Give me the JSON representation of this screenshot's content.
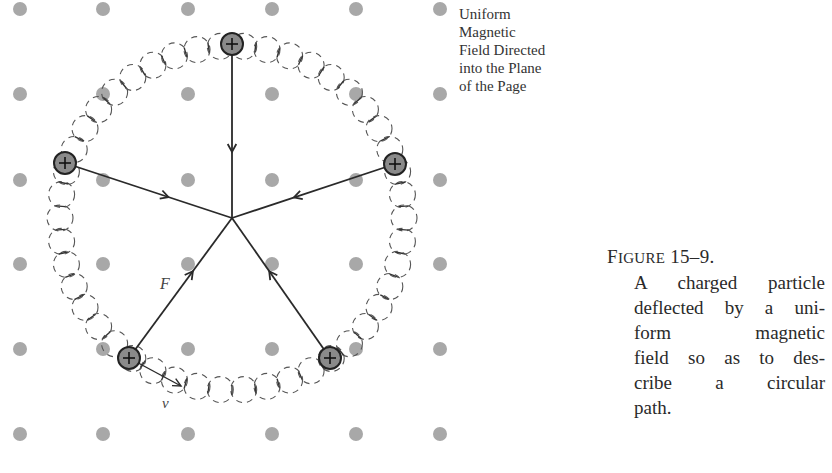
{
  "field_label": {
    "lines": [
      "Uniform",
      "Magnetic",
      "Field Directed",
      "into the Plane",
      "of the Page"
    ]
  },
  "caption": {
    "figure_prefix": "F",
    "figure_smallcaps": "IGURE",
    "figure_number": " 15–9.",
    "lines": [
      "A charged particle",
      "deflected by a uni-",
      "form magnetic",
      "field so as to des-",
      "cribe a circular",
      "path."
    ]
  },
  "labels": {
    "force": "F",
    "velocity": "v"
  },
  "colors": {
    "field_dot": "#a8a8a8",
    "charge_fill": "#8a8a8a",
    "line": "#2a2a2a",
    "background": "#ffffff"
  },
  "geometry": {
    "center": [
      232,
      218
    ],
    "path_radius": 172,
    "grid_x": [
      20,
      103,
      188,
      272,
      356,
      440
    ],
    "grid_y": [
      9,
      94,
      180,
      264,
      349,
      434
    ],
    "charges": [
      [
        232,
        44
      ],
      [
        65,
        163
      ],
      [
        395,
        164
      ],
      [
        129,
        358
      ],
      [
        330,
        358
      ]
    ]
  }
}
